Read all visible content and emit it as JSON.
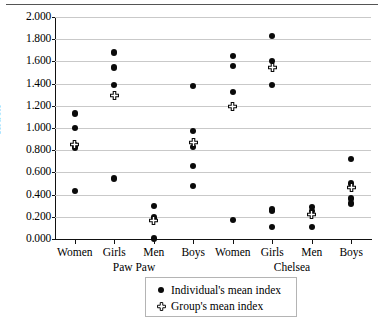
{
  "chart_data": {
    "type": "scatter",
    "title": "",
    "xlabel": "",
    "ylabel": "Index",
    "ylim": [
      0.0,
      2.0
    ],
    "ytick_labels": [
      "0.000",
      "0.200",
      "0.400",
      "0.600",
      "0.800",
      "1.000",
      "1.200",
      "1.400",
      "1.600",
      "1.800",
      "2.000"
    ],
    "ytick_values": [
      0.0,
      0.2,
      0.4,
      0.6,
      0.8,
      1.0,
      1.2,
      1.4,
      1.6,
      1.8,
      2.0
    ],
    "grid": true,
    "legend_position": "below-axes-center",
    "legend": [
      {
        "marker": "filled-circle",
        "label": "Individual's mean index"
      },
      {
        "marker": "outline-cross",
        "label": "Group's mean index"
      }
    ],
    "supergroups": [
      {
        "label": "Paw Paw",
        "categories": [
          "Women",
          "Girls",
          "Men",
          "Boys"
        ]
      },
      {
        "label": "Chelsea",
        "categories": [
          "Women",
          "Girls",
          "Men",
          "Boys"
        ]
      }
    ],
    "categories": [
      "Women",
      "Girls",
      "Men",
      "Boys",
      "Women",
      "Girls",
      "Men",
      "Boys"
    ],
    "series": [
      {
        "name": "Individual's mean index",
        "marker": "filled-circle",
        "groups": [
          {
            "category": "Women",
            "supergroup": "Paw Paw",
            "values": [
              1.13,
              1.0,
              0.845,
              0.825,
              0.435
            ]
          },
          {
            "category": "Girls",
            "supergroup": "Paw Paw",
            "values": [
              1.68,
              1.545,
              1.39,
              0.545
            ]
          },
          {
            "category": "Men",
            "supergroup": "Paw Paw",
            "values": [
              0.295,
              0.2,
              0.18,
              0.005
            ]
          },
          {
            "category": "Boys",
            "supergroup": "Paw Paw",
            "values": [
              1.38,
              0.975,
              0.83,
              0.655,
              0.48
            ]
          },
          {
            "category": "Women",
            "supergroup": "Chelsea",
            "values": [
              1.645,
              1.555,
              1.325,
              0.17
            ]
          },
          {
            "category": "Girls",
            "supergroup": "Chelsea",
            "values": [
              1.83,
              1.6,
              1.39,
              0.265,
              0.25,
              0.105
            ]
          },
          {
            "category": "Men",
            "supergroup": "Chelsea",
            "values": [
              0.285,
              0.255,
              0.105
            ]
          },
          {
            "category": "Boys",
            "supergroup": "Chelsea",
            "values": [
              0.72,
              0.5,
              0.365,
              0.32
            ]
          }
        ]
      },
      {
        "name": "Group's mean index",
        "marker": "outline-cross",
        "groups": [
          {
            "category": "Women",
            "supergroup": "Paw Paw",
            "value": 0.855
          },
          {
            "category": "Girls",
            "supergroup": "Paw Paw",
            "value": 1.29
          },
          {
            "category": "Men",
            "supergroup": "Paw Paw",
            "value": 0.17
          },
          {
            "category": "Boys",
            "supergroup": "Paw Paw",
            "value": 0.865
          },
          {
            "category": "Women",
            "supergroup": "Chelsea",
            "value": 1.19
          },
          {
            "category": "Girls",
            "supergroup": "Chelsea",
            "value": 1.545
          },
          {
            "category": "Men",
            "supergroup": "Chelsea",
            "value": 0.225
          },
          {
            "category": "Boys",
            "supergroup": "Chelsea",
            "value": 0.465
          }
        ]
      }
    ],
    "colors": {
      "marker": "#0a0a0a",
      "grid": "#c9c9c9",
      "axis": "#111111",
      "background": "#ffffff"
    }
  }
}
